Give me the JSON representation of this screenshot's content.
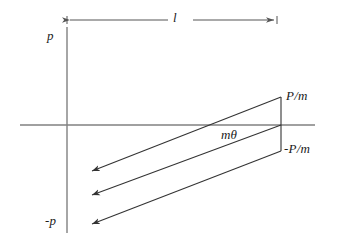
{
  "figure": {
    "type": "phase-space-diagram",
    "width": 337,
    "height": 242,
    "background_color": "#ffffff",
    "axis_color": "#808080",
    "line_color": "#333333",
    "label_color": "#1a1a1a"
  },
  "axes": {
    "vertical": {
      "name": "momentum-axis",
      "x": 67,
      "y_top": 27,
      "y_bottom": 233,
      "positive_label": "p",
      "negative_label": "-p"
    },
    "horizontal": {
      "name": "position-axis",
      "y": 125,
      "x_left": 20,
      "x_right": 315
    }
  },
  "dimension": {
    "name": "length-dimension",
    "label": "l",
    "x_start": 67,
    "x_end": 277,
    "y": 20,
    "arrows": "both"
  },
  "labels": {
    "p_top": "p",
    "p_bottom": "-p",
    "length": "l",
    "p_over_m": "P/m",
    "neg_p_over_m": "-P/m",
    "m_theta": "mθ"
  },
  "parallelogram": {
    "name": "sheared-beam-region",
    "right_edge": {
      "x": 281,
      "y_top": 97,
      "y_bottom": 151
    },
    "shear_lines": [
      {
        "name": "top-line",
        "x1": 281,
        "y1": 97,
        "x2": 89,
        "y2": 172
      },
      {
        "name": "middle-line",
        "x1": 281,
        "y1": 125,
        "x2": 89,
        "y2": 196
      },
      {
        "name": "bottom-line",
        "x1": 281,
        "y1": 151,
        "x2": 89,
        "y2": 225
      }
    ],
    "arrow_direction": "left-down"
  }
}
